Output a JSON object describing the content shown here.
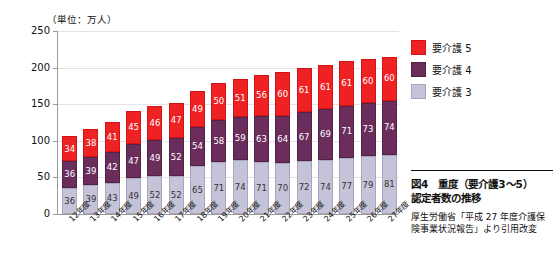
{
  "chart_data": {
    "type": "bar",
    "stacked": true,
    "unit_label": "（単位：万人）",
    "xlabel": "",
    "ylabel": "",
    "ylim": [
      0,
      250
    ],
    "yticks": [
      0,
      50,
      100,
      150,
      200,
      250
    ],
    "grid": true,
    "legend_position": "right-top",
    "categories": [
      "12年度",
      "13年度",
      "14年度",
      "15年度",
      "16年度",
      "17年度",
      "18年度",
      "19年度",
      "20年度",
      "21年度",
      "22年度",
      "23年度",
      "24年度",
      "25年度",
      "26年度",
      "27年度"
    ],
    "series": [
      {
        "name": "要介護3",
        "color": "#c5c3d8",
        "values": [
          36,
          39,
          43,
          49,
          52,
          52,
          65,
          71,
          74,
          71,
          70,
          72,
          74,
          77,
          79,
          81
        ]
      },
      {
        "name": "要介護4",
        "color": "#6b2d5c",
        "values": [
          36,
          39,
          42,
          47,
          49,
          52,
          54,
          58,
          59,
          63,
          64,
          67,
          69,
          71,
          73,
          74
        ]
      },
      {
        "name": "要介護5",
        "color": "#ee2222",
        "values": [
          34,
          38,
          41,
          45,
          46,
          47,
          49,
          50,
          51,
          56,
          60,
          61,
          61,
          61,
          60,
          60
        ]
      }
    ],
    "totals": [
      106,
      116,
      126,
      141,
      147,
      151,
      168,
      179,
      184,
      190,
      194,
      200,
      204,
      209,
      212,
      215
    ]
  },
  "legend": {
    "items": [
      {
        "label": "要介護 5",
        "swatch": "s5"
      },
      {
        "label": "要介護 4",
        "swatch": "s4"
      },
      {
        "label": "要介護 3",
        "swatch": "s3"
      }
    ]
  },
  "caption": {
    "title_line1": "図4　重度（要介護3〜5）",
    "title_line2": "認定者数の推移",
    "source": "厚生労働省「平成 27 年度介護保険事業状況報告」より引用改変"
  }
}
